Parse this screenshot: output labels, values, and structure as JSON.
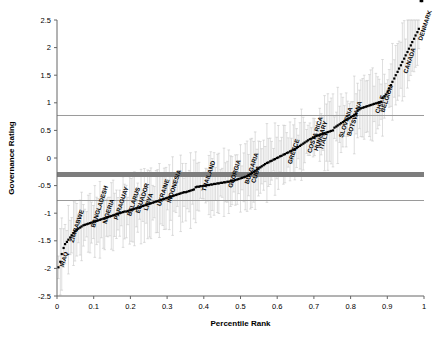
{
  "chart_data": {
    "type": "scatter",
    "title": "",
    "xlabel": "Percentile Rank",
    "ylabel": "Governance Rating",
    "xlim": [
      0,
      1
    ],
    "ylim": [
      -2.5,
      2.5
    ],
    "xticks": [
      "0",
      "0.1",
      "0.2",
      "0.3",
      "0.4",
      "0.5",
      "0.6",
      "0.7",
      "0.8",
      "0.9",
      "1"
    ],
    "xtick_values": [
      0,
      0.1,
      0.2,
      0.3,
      0.4,
      0.5,
      0.6,
      0.7,
      0.8,
      0.9,
      1
    ],
    "yticks": [
      "2.5",
      "2",
      "1.5",
      "1",
      "0.5",
      "0",
      "-0.5",
      "-1",
      "-1.5",
      "-2",
      "-2.5"
    ],
    "ytick_values": [
      2.5,
      2,
      1.5,
      1,
      0.5,
      0,
      -0.5,
      -1,
      -1.5,
      -2,
      -2.5
    ],
    "grid": false,
    "legend": "none",
    "marker": "square",
    "marker_color": "#000000",
    "errorbar_color": "#c8c8c8",
    "reference_lines": [
      {
        "name": "upper-reference-line",
        "y": 0.77,
        "color": "#9a9a9a",
        "width": 1,
        "style": "thin"
      },
      {
        "name": "median-band",
        "y": -0.3,
        "color": "#7d7d7d",
        "width": 5,
        "style": "thick"
      },
      {
        "name": "lower-reference-line",
        "y": -0.77,
        "color": "#9a9a9a",
        "width": 1,
        "style": "thin"
      }
    ],
    "x": [
      0.004,
      0.009,
      0.013,
      0.018,
      0.022,
      0.027,
      0.031,
      0.036,
      0.04,
      0.045,
      0.049,
      0.054,
      0.058,
      0.063,
      0.067,
      0.072,
      0.076,
      0.081,
      0.085,
      0.09,
      0.094,
      0.099,
      0.103,
      0.108,
      0.112,
      0.117,
      0.121,
      0.126,
      0.13,
      0.135,
      0.139,
      0.144,
      0.148,
      0.153,
      0.157,
      0.162,
      0.166,
      0.171,
      0.175,
      0.18,
      0.184,
      0.189,
      0.193,
      0.198,
      0.202,
      0.207,
      0.211,
      0.216,
      0.22,
      0.225,
      0.229,
      0.234,
      0.238,
      0.243,
      0.247,
      0.252,
      0.256,
      0.261,
      0.265,
      0.27,
      0.274,
      0.279,
      0.283,
      0.288,
      0.292,
      0.297,
      0.301,
      0.306,
      0.31,
      0.315,
      0.319,
      0.324,
      0.328,
      0.333,
      0.337,
      0.342,
      0.346,
      0.351,
      0.355,
      0.36,
      0.364,
      0.369,
      0.373,
      0.378,
      0.382,
      0.387,
      0.391,
      0.396,
      0.4,
      0.405,
      0.409,
      0.414,
      0.419,
      0.423,
      0.428,
      0.432,
      0.437,
      0.441,
      0.446,
      0.45,
      0.455,
      0.459,
      0.464,
      0.468,
      0.473,
      0.477,
      0.482,
      0.486,
      0.491,
      0.495,
      0.5,
      0.504,
      0.509,
      0.513,
      0.518,
      0.522,
      0.527,
      0.531,
      0.536,
      0.54,
      0.545,
      0.549,
      0.554,
      0.558,
      0.563,
      0.567,
      0.572,
      0.576,
      0.581,
      0.585,
      0.59,
      0.594,
      0.599,
      0.603,
      0.608,
      0.612,
      0.617,
      0.621,
      0.626,
      0.63,
      0.635,
      0.639,
      0.644,
      0.648,
      0.653,
      0.657,
      0.662,
      0.666,
      0.671,
      0.675,
      0.68,
      0.684,
      0.689,
      0.693,
      0.698,
      0.702,
      0.707,
      0.711,
      0.716,
      0.72,
      0.725,
      0.729,
      0.734,
      0.738,
      0.743,
      0.747,
      0.752,
      0.756,
      0.761,
      0.765,
      0.77,
      0.774,
      0.779,
      0.783,
      0.788,
      0.792,
      0.797,
      0.801,
      0.806,
      0.81,
      0.815,
      0.819,
      0.824,
      0.828,
      0.833,
      0.837,
      0.842,
      0.846,
      0.851,
      0.855,
      0.86,
      0.864,
      0.869,
      0.874,
      0.878,
      0.883,
      0.887,
      0.892,
      0.896,
      0.901,
      0.905,
      0.91,
      0.914,
      0.919,
      0.923,
      0.928,
      0.932,
      0.937,
      0.941,
      0.946,
      0.95,
      0.955,
      0.959,
      0.964,
      0.968,
      0.973,
      0.977,
      0.982,
      0.986,
      0.991,
      0.995
    ],
    "y": [
      -1.98,
      -1.88,
      -1.74,
      -1.63,
      -1.56,
      -1.52,
      -1.48,
      -1.44,
      -1.4,
      -1.36,
      -1.33,
      -1.3,
      -1.28,
      -1.26,
      -1.24,
      -1.22,
      -1.21,
      -1.2,
      -1.19,
      -1.18,
      -1.17,
      -1.16,
      -1.15,
      -1.14,
      -1.13,
      -1.12,
      -1.11,
      -1.1,
      -1.09,
      -1.08,
      -1.07,
      -1.06,
      -1.05,
      -1.04,
      -1.03,
      -1.02,
      -1.01,
      -1.0,
      -0.99,
      -0.98,
      -0.97,
      -0.97,
      -0.96,
      -0.95,
      -0.94,
      -0.93,
      -0.92,
      -0.91,
      -0.9,
      -0.89,
      -0.88,
      -0.87,
      -0.86,
      -0.85,
      -0.84,
      -0.83,
      -0.82,
      -0.81,
      -0.8,
      -0.79,
      -0.78,
      -0.77,
      -0.76,
      -0.75,
      -0.74,
      -0.73,
      -0.72,
      -0.71,
      -0.7,
      -0.69,
      -0.68,
      -0.67,
      -0.66,
      -0.65,
      -0.64,
      -0.63,
      -0.62,
      -0.62,
      -0.61,
      -0.6,
      -0.59,
      -0.58,
      -0.57,
      -0.53,
      -0.52,
      -0.52,
      -0.51,
      -0.51,
      -0.5,
      -0.5,
      -0.49,
      -0.49,
      -0.48,
      -0.48,
      -0.47,
      -0.47,
      -0.46,
      -0.46,
      -0.45,
      -0.45,
      -0.44,
      -0.44,
      -0.43,
      -0.43,
      -0.42,
      -0.41,
      -0.41,
      -0.4,
      -0.39,
      -0.38,
      -0.37,
      -0.36,
      -0.35,
      -0.34,
      -0.33,
      -0.31,
      -0.29,
      -0.27,
      -0.25,
      -0.23,
      -0.21,
      -0.19,
      -0.17,
      -0.15,
      -0.13,
      -0.11,
      -0.09,
      -0.08,
      -0.06,
      -0.05,
      -0.03,
      -0.02,
      0.0,
      0.01,
      0.03,
      0.04,
      0.06,
      0.07,
      0.09,
      0.1,
      0.12,
      0.13,
      0.15,
      0.16,
      0.18,
      0.2,
      0.22,
      0.24,
      0.26,
      0.28,
      0.3,
      0.32,
      0.34,
      0.35,
      0.37,
      0.38,
      0.4,
      0.41,
      0.42,
      0.43,
      0.44,
      0.45,
      0.46,
      0.47,
      0.48,
      0.49,
      0.5,
      0.55,
      0.57,
      0.59,
      0.61,
      0.63,
      0.65,
      0.67,
      0.69,
      0.71,
      0.72,
      0.74,
      0.76,
      0.78,
      0.8,
      0.86,
      0.88,
      0.9,
      0.91,
      0.92,
      0.93,
      0.94,
      0.95,
      0.96,
      0.97,
      0.98,
      0.99,
      1.0,
      1.01,
      1.02,
      1.09,
      1.12,
      1.15,
      1.2,
      1.26,
      1.32,
      1.38,
      1.44,
      1.5,
      1.56,
      1.62,
      1.68,
      1.74,
      1.8,
      1.86,
      1.92,
      1.98,
      2.04,
      2.1,
      2.16,
      2.22,
      2.28,
      2.34
    ],
    "errorbars": {
      "typical_half_width": 0.42,
      "description": "light gray vertical error bars with end caps on every data point"
    },
    "annotations": [
      {
        "label": "IRAQ",
        "x": 0.009,
        "y": -1.88
      },
      {
        "label": "ZIMBABWE",
        "x": 0.036,
        "y": -1.44
      },
      {
        "label": "BANGLADESH",
        "x": 0.094,
        "y": -1.17
      },
      {
        "label": "NIGERIA",
        "x": 0.126,
        "y": -1.1
      },
      {
        "label": "PARAGUAY",
        "x": 0.157,
        "y": -1.03
      },
      {
        "label": "BELARUS",
        "x": 0.193,
        "y": -0.96
      },
      {
        "label": "ECUADOR",
        "x": 0.216,
        "y": -0.91
      },
      {
        "label": "LIBYA",
        "x": 0.238,
        "y": -0.86
      },
      {
        "label": "UKRAINE",
        "x": 0.274,
        "y": -0.78
      },
      {
        "label": "INDONESIA",
        "x": 0.301,
        "y": -0.72
      },
      {
        "label": "THAILAND",
        "x": 0.396,
        "y": -0.51
      },
      {
        "label": "GEORGIA",
        "x": 0.468,
        "y": -0.45
      },
      {
        "label": "BULGARIA",
        "x": 0.513,
        "y": -0.38
      },
      {
        "label": "CUBA",
        "x": 0.531,
        "y": -0.36
      },
      {
        "label": "GREECE",
        "x": 0.63,
        "y": -0.02
      },
      {
        "label": "COSTA RICA",
        "x": 0.684,
        "y": 0.18
      },
      {
        "label": "HUNGARY",
        "x": 0.702,
        "y": 0.22
      },
      {
        "label": "ITALY",
        "x": 0.716,
        "y": 0.26
      },
      {
        "label": "SLOVENIA",
        "x": 0.77,
        "y": 0.46
      },
      {
        "label": "BOTSWANA",
        "x": 0.792,
        "y": 0.49
      },
      {
        "label": "CHILE",
        "x": 0.869,
        "y": 0.9
      },
      {
        "label": "BELGIUM",
        "x": 0.883,
        "y": 0.92
      },
      {
        "label": "CANADA",
        "x": 0.946,
        "y": 1.62
      },
      {
        "label": "DENMARK",
        "x": 0.986,
        "y": 2.22
      }
    ]
  }
}
